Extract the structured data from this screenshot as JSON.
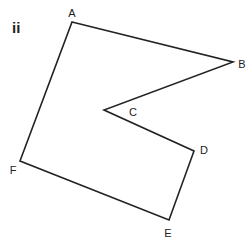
{
  "figure": {
    "label": "ii",
    "stroke_color": "#222222",
    "background": "#ffffff"
  },
  "vertices": [
    {
      "name": "A",
      "x": 72,
      "y": 22,
      "lx": 72,
      "ly": 17
    },
    {
      "name": "B",
      "x": 233,
      "y": 62,
      "lx": 242,
      "ly": 68
    },
    {
      "name": "C",
      "x": 104,
      "y": 110,
      "lx": 133,
      "ly": 116
    },
    {
      "name": "D",
      "x": 194,
      "y": 151,
      "lx": 204,
      "ly": 154
    },
    {
      "name": "E",
      "x": 169,
      "y": 220,
      "lx": 168,
      "ly": 237
    },
    {
      "name": "F",
      "x": 20,
      "y": 161,
      "lx": 13,
      "ly": 174
    }
  ],
  "edges": [
    [
      "A",
      "B"
    ],
    [
      "B",
      "C"
    ],
    [
      "C",
      "D"
    ],
    [
      "D",
      "E"
    ],
    [
      "E",
      "F"
    ],
    [
      "F",
      "A"
    ]
  ]
}
